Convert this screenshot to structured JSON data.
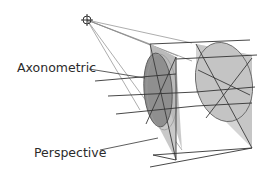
{
  "diagram": {
    "title": "",
    "labels": {
      "axonometric": "Axonometric",
      "perspective": "Perspective"
    },
    "viewpoint": {
      "icon": "crosshair-circle-icon",
      "x": 87,
      "y": 20
    },
    "colors": {
      "line": "#333333",
      "projector": "#8a8a8a",
      "fill_light": "#c8c8c8",
      "fill_mid": "#b0b0b0",
      "fill_dark": "#8e8e8e",
      "background": "#ffffff"
    },
    "elements": [
      {
        "name": "near-disc",
        "description": "tilted ellipse (perspective projection of circle) on near plane, darker gray"
      },
      {
        "name": "far-disc",
        "description": "larger ellipse (axonometric circle) on far plane, lighter gray"
      },
      {
        "name": "projection-rays",
        "description": "lines radiating from viewpoint to disc edges"
      },
      {
        "name": "parallel-lines",
        "description": "horizontal parallel lines crossing both planes"
      }
    ]
  }
}
